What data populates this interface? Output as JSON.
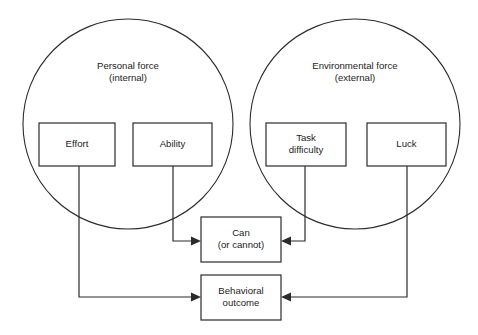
{
  "diagram": {
    "background_color": "#ffffff",
    "line_color": "#2b2b2b",
    "text_color": "#1d1d1d",
    "groups": [
      {
        "id": "personal-force",
        "shape": "circle",
        "label": "Personal force\n(internal)",
        "label_line_1": "Personal force",
        "label_line_2": "(internal)",
        "cx": 128,
        "cy": 124,
        "r": 105
      },
      {
        "id": "environmental-force",
        "shape": "circle",
        "label": "Environmental force\n(external)",
        "label_line_1": "Environmental force",
        "label_line_2": "(external)",
        "cx": 355,
        "cy": 124,
        "r": 105
      }
    ],
    "boxes": [
      {
        "id": "effort",
        "label": "Effort",
        "x": 39,
        "y": 123,
        "w": 76,
        "h": 43
      },
      {
        "id": "ability",
        "label": "Ability",
        "x": 133,
        "y": 123,
        "w": 79,
        "h": 43
      },
      {
        "id": "task-difficulty",
        "label": "Task\ndifficulty",
        "label_line_1": "Task",
        "label_line_2": "difficulty",
        "x": 266,
        "y": 123,
        "w": 80,
        "h": 43
      },
      {
        "id": "luck",
        "label": "Luck",
        "x": 367,
        "y": 123,
        "w": 79,
        "h": 43
      },
      {
        "id": "can-or-cannot",
        "label": "Can\n(or cannot)",
        "label_line_1": "Can",
        "label_line_2": "(or cannot)",
        "x": 201,
        "y": 217,
        "w": 80,
        "h": 45
      },
      {
        "id": "behavioral-outcome",
        "label": "Behavioral\noutcome",
        "label_line_1": "Behavioral",
        "label_line_2": "outcome",
        "x": 201,
        "y": 275,
        "w": 80,
        "h": 45
      }
    ],
    "connectors": [
      {
        "id": "ability-to-can",
        "from": "ability",
        "to": "can-or-cannot",
        "direction": "right",
        "path": "M173,166 L173,241 L198,241"
      },
      {
        "id": "task-difficulty-to-can",
        "from": "task-difficulty",
        "to": "can-or-cannot",
        "direction": "left",
        "path": "M305,166 L305,241 L284,241"
      },
      {
        "id": "effort-to-behavioral-outcome",
        "from": "effort",
        "to": "behavioral-outcome",
        "direction": "right",
        "path": "M79,166 L79,297 L198,297"
      },
      {
        "id": "luck-to-behavioral-outcome",
        "from": "luck",
        "to": "behavioral-outcome",
        "direction": "left",
        "path": "M407,166 L407,297 L284,297"
      }
    ]
  }
}
